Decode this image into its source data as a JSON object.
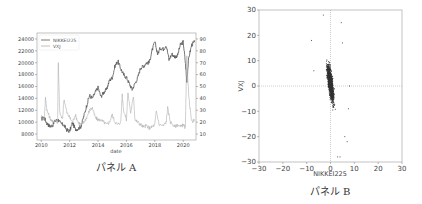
{
  "chart_data": [
    {
      "type": "line",
      "caption": "パネル A",
      "xlabel": "date",
      "ylabel_left": "",
      "ylabel_right": "",
      "x_ticks": [
        "2010",
        "2012",
        "2014",
        "2016",
        "2018",
        "2020"
      ],
      "xlim": [
        2009.7,
        2020.9
      ],
      "ylim_left": [
        7000,
        25000
      ],
      "ylim_right": [
        5,
        95
      ],
      "y_ticks_left": [
        "8000",
        "10000",
        "12000",
        "14000",
        "16000",
        "18000",
        "20000",
        "22000",
        "24000"
      ],
      "y_ticks_right": [
        "10",
        "20",
        "30",
        "40",
        "50",
        "60",
        "70",
        "80",
        "90"
      ],
      "legend": {
        "position": "top-left",
        "entries": [
          "NIKKEI225",
          "VXJ"
        ]
      },
      "series": [
        {
          "name": "NIKKEI225",
          "axis": "left",
          "color": "#555555",
          "x": [
            2010.0,
            2010.2,
            2010.4,
            2010.6,
            2010.8,
            2011.0,
            2011.2,
            2011.4,
            2011.6,
            2011.8,
            2012.0,
            2012.2,
            2012.4,
            2012.6,
            2012.8,
            2013.0,
            2013.2,
            2013.4,
            2013.6,
            2013.8,
            2014.0,
            2014.2,
            2014.4,
            2014.6,
            2014.8,
            2015.0,
            2015.2,
            2015.4,
            2015.6,
            2015.8,
            2016.0,
            2016.2,
            2016.4,
            2016.6,
            2016.8,
            2017.0,
            2017.2,
            2017.4,
            2017.6,
            2017.8,
            2018.0,
            2018.2,
            2018.4,
            2018.6,
            2018.8,
            2019.0,
            2019.2,
            2019.4,
            2019.6,
            2019.8,
            2020.0,
            2020.15,
            2020.25,
            2020.4,
            2020.6,
            2020.8
          ],
          "values": [
            10500,
            10800,
            9800,
            9300,
            9500,
            10300,
            10400,
            9700,
            9500,
            8700,
            8500,
            9900,
            8800,
            8900,
            9300,
            11000,
            12800,
            14500,
            14000,
            15000,
            15800,
            14300,
            15000,
            15500,
            17000,
            17500,
            19500,
            20300,
            19000,
            18000,
            17500,
            16500,
            15500,
            16500,
            17500,
            19200,
            19400,
            20000,
            20000,
            22000,
            23500,
            21500,
            22500,
            22300,
            23000,
            20500,
            21500,
            21000,
            21200,
            23000,
            23500,
            20000,
            17000,
            21000,
            23000,
            23500
          ]
        },
        {
          "name": "VXJ",
          "axis": "right",
          "color": "#b0b0b0",
          "x": [
            2010.0,
            2010.2,
            2010.3,
            2010.4,
            2010.6,
            2010.8,
            2011.0,
            2011.15,
            2011.2,
            2011.3,
            2011.5,
            2011.6,
            2011.8,
            2012.0,
            2012.2,
            2012.4,
            2012.6,
            2012.8,
            2013.0,
            2013.2,
            2013.4,
            2013.6,
            2013.8,
            2014.0,
            2014.2,
            2014.4,
            2014.6,
            2014.8,
            2015.0,
            2015.2,
            2015.4,
            2015.6,
            2015.7,
            2015.8,
            2016.0,
            2016.1,
            2016.3,
            2016.5,
            2016.6,
            2016.8,
            2017.0,
            2017.2,
            2017.4,
            2017.6,
            2017.8,
            2018.0,
            2018.1,
            2018.3,
            2018.6,
            2018.8,
            2018.9,
            2019.1,
            2019.4,
            2019.6,
            2019.8,
            2020.0,
            2020.15,
            2020.25,
            2020.4,
            2020.6,
            2020.8
          ],
          "values": [
            25,
            22,
            40,
            30,
            24,
            20,
            22,
            20,
            70,
            28,
            22,
            40,
            28,
            24,
            20,
            26,
            20,
            18,
            20,
            24,
            30,
            32,
            24,
            22,
            22,
            20,
            18,
            20,
            26,
            20,
            18,
            20,
            43,
            30,
            22,
            45,
            28,
            42,
            22,
            20,
            18,
            16,
            17,
            15,
            16,
            18,
            30,
            18,
            17,
            20,
            32,
            20,
            16,
            18,
            16,
            18,
            15,
            75,
            40,
            20,
            22
          ]
        }
      ]
    },
    {
      "type": "scatter",
      "caption": "パネル B",
      "xlabel": "NIKKEI225",
      "ylabel": "VXJ",
      "xlim": [
        -30,
        30
      ],
      "ylim": [
        -30,
        30
      ],
      "x_ticks": [
        "-30",
        "-20",
        "-10",
        "0",
        "10",
        "20",
        "30"
      ],
      "y_ticks": [
        "-30",
        "-20",
        "-10",
        "0",
        "10",
        "20",
        "30"
      ],
      "reference_lines": {
        "x": 0,
        "y": 0,
        "style": "dotted"
      },
      "point_count_estimate": 2500,
      "relationship": "negative correlation, slope approx -3.5, dense cluster x in [-4,4], y in [-15,20]",
      "outliers": [
        [
          -8,
          18
        ],
        [
          4.5,
          25
        ],
        [
          5,
          17
        ],
        [
          -3,
          28
        ],
        [
          3,
          -28
        ],
        [
          4,
          -28
        ],
        [
          7,
          -22
        ],
        [
          7.5,
          -9
        ],
        [
          6,
          -20
        ],
        [
          8,
          0
        ],
        [
          -7,
          6
        ]
      ]
    }
  ]
}
